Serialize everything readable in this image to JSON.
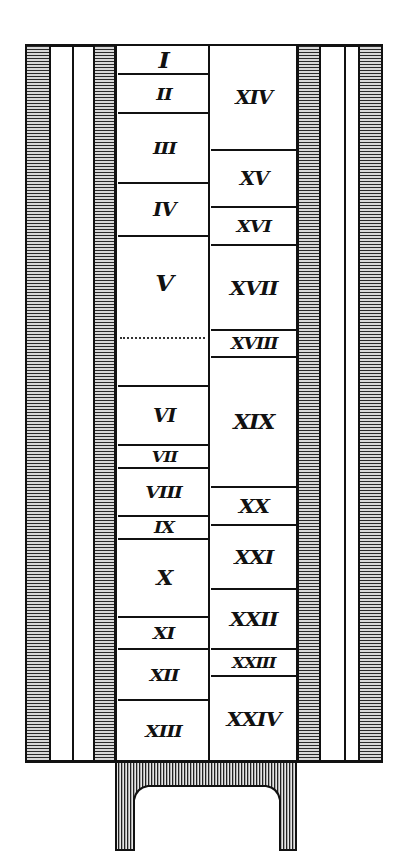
{
  "diagram": {
    "type": "column-section",
    "left_column": {
      "x": [
        117,
        210
      ],
      "layers": [
        {
          "label": "I",
          "top": 46,
          "bottom": 73,
          "font": 22
        },
        {
          "label": "II",
          "top": 73,
          "bottom": 112,
          "font": 17
        },
        {
          "label": "III",
          "top": 112,
          "bottom": 182,
          "font": 17
        },
        {
          "label": "IV",
          "top": 182,
          "bottom": 235,
          "font": 18
        },
        {
          "label": "V",
          "top": 235,
          "bottom": 385,
          "font": 22,
          "label_center": 283,
          "dotted_line": 337
        },
        {
          "label": "VI",
          "top": 385,
          "bottom": 444,
          "font": 18
        },
        {
          "label": "VII",
          "top": 444,
          "bottom": 467,
          "font": 15
        },
        {
          "label": "VIII",
          "top": 467,
          "bottom": 515,
          "font": 17
        },
        {
          "label": "IX",
          "top": 515,
          "bottom": 538,
          "font": 16
        },
        {
          "label": "X",
          "top": 538,
          "bottom": 616,
          "font": 20
        },
        {
          "label": "XI",
          "top": 616,
          "bottom": 648,
          "font": 17
        },
        {
          "label": "XII",
          "top": 648,
          "bottom": 699,
          "font": 17
        },
        {
          "label": "XIII",
          "top": 699,
          "bottom": 760,
          "font": 17
        }
      ]
    },
    "right_column": {
      "x": [
        210,
        297
      ],
      "layers": [
        {
          "label": "XIV",
          "top": 46,
          "bottom": 149,
          "font": 18
        },
        {
          "label": "XV",
          "top": 149,
          "bottom": 206,
          "font": 18
        },
        {
          "label": "XVI",
          "top": 206,
          "bottom": 244,
          "font": 17
        },
        {
          "label": "XVII",
          "top": 244,
          "bottom": 329,
          "font": 19
        },
        {
          "label": "XVIII",
          "top": 329,
          "bottom": 356,
          "font": 16
        },
        {
          "label": "XIX",
          "top": 356,
          "bottom": 486,
          "font": 20
        },
        {
          "label": "XX",
          "top": 486,
          "bottom": 524,
          "font": 19
        },
        {
          "label": "XXI",
          "top": 524,
          "bottom": 588,
          "font": 19
        },
        {
          "label": "XXII",
          "top": 588,
          "bottom": 648,
          "font": 19
        },
        {
          "label": "XXIII",
          "top": 648,
          "bottom": 675,
          "font": 15
        },
        {
          "label": "XXIV",
          "top": 675,
          "bottom": 760,
          "font": 19
        }
      ]
    },
    "colors": {
      "ink": "#111111",
      "paper": "#ffffff",
      "hatch_light": "#d8d8d8"
    }
  }
}
